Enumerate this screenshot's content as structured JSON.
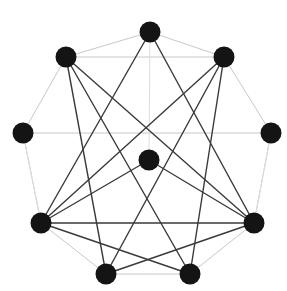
{
  "figure": {
    "kind": "node-link-diagram",
    "width": 287,
    "height": 291,
    "background_color": "#ffffff"
  },
  "style": {
    "node_fill": "#141414",
    "node_radius": 10.5,
    "ring_edge_color": "#c8c8c8",
    "ring_edge_width": 1.0,
    "chord_edge_color": "#3a3a3a",
    "chord_edge_width": 1.4,
    "faint_edge_color": "#dcdcdc",
    "faint_edge_width": 1.0
  },
  "chart_data": {
    "type": "scatter",
    "xlabel": "",
    "ylabel": "",
    "grid": false,
    "legend": "none",
    "xlim": [
      0,
      287
    ],
    "ylim": [
      0,
      291
    ],
    "nodes": [
      {
        "id": "n0",
        "label": "top",
        "x": 150,
        "y": 32,
        "degree": 5
      },
      {
        "id": "n1",
        "label": "upper-right",
        "x": 224,
        "y": 57,
        "degree": 6
      },
      {
        "id": "n2",
        "label": "right",
        "x": 271,
        "y": 133,
        "degree": 4
      },
      {
        "id": "n3",
        "label": "lower-right",
        "x": 254,
        "y": 223,
        "degree": 7
      },
      {
        "id": "n4",
        "label": "bottom-right",
        "x": 190,
        "y": 274,
        "degree": 5
      },
      {
        "id": "n5",
        "label": "bottom-left",
        "x": 106,
        "y": 274,
        "degree": 5
      },
      {
        "id": "n6",
        "label": "lower-left",
        "x": 41,
        "y": 223,
        "degree": 7
      },
      {
        "id": "n7",
        "label": "left",
        "x": 23,
        "y": 133,
        "degree": 4
      },
      {
        "id": "n8",
        "label": "upper-left",
        "x": 66,
        "y": 57,
        "degree": 6
      },
      {
        "id": "n9",
        "label": "center",
        "x": 149,
        "y": 160,
        "degree": 3
      }
    ],
    "edges": [
      {
        "source": "n0",
        "target": "n1",
        "class": "ring"
      },
      {
        "source": "n1",
        "target": "n2",
        "class": "ring"
      },
      {
        "source": "n2",
        "target": "n3",
        "class": "ring"
      },
      {
        "source": "n3",
        "target": "n4",
        "class": "ring"
      },
      {
        "source": "n4",
        "target": "n5",
        "class": "ring"
      },
      {
        "source": "n5",
        "target": "n6",
        "class": "ring"
      },
      {
        "source": "n6",
        "target": "n7",
        "class": "ring"
      },
      {
        "source": "n7",
        "target": "n8",
        "class": "ring"
      },
      {
        "source": "n8",
        "target": "n0",
        "class": "ring"
      },
      {
        "source": "n8",
        "target": "n1",
        "class": "ring"
      },
      {
        "source": "n7",
        "target": "n2",
        "class": "ring"
      },
      {
        "source": "n0",
        "target": "n9",
        "class": "faint"
      },
      {
        "source": "n0",
        "target": "n3",
        "class": "chord"
      },
      {
        "source": "n0",
        "target": "n6",
        "class": "chord"
      },
      {
        "source": "n1",
        "target": "n6",
        "class": "chord"
      },
      {
        "source": "n1",
        "target": "n5",
        "class": "chord"
      },
      {
        "source": "n1",
        "target": "n4",
        "class": "chord"
      },
      {
        "source": "n8",
        "target": "n3",
        "class": "chord"
      },
      {
        "source": "n8",
        "target": "n4",
        "class": "chord"
      },
      {
        "source": "n8",
        "target": "n5",
        "class": "chord"
      },
      {
        "source": "n6",
        "target": "n3",
        "class": "chord"
      },
      {
        "source": "n6",
        "target": "n4",
        "class": "chord"
      },
      {
        "source": "n6",
        "target": "n9",
        "class": "chord"
      },
      {
        "source": "n3",
        "target": "n5",
        "class": "chord"
      },
      {
        "source": "n3",
        "target": "n9",
        "class": "chord"
      },
      {
        "source": "n2",
        "target": "n3",
        "class": "faint"
      },
      {
        "source": "n7",
        "target": "n6",
        "class": "faint"
      }
    ]
  }
}
